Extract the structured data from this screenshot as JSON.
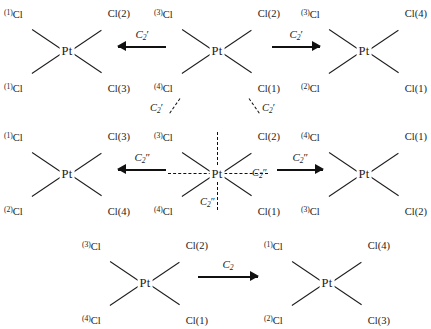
{
  "diagram": {
    "center_atom": "Pt",
    "rows": [
      {
        "row_id": "row-1",
        "structures": [
          {
            "id": "s1",
            "labels": {
              "top_left": "Cl",
              "top_left_num": "(1)",
              "top_right": "Cl",
              "top_right_num": "(2)",
              "bottom_left": "Cl",
              "bottom_left_num": "(1)",
              "bottom_right": "Cl",
              "bottom_right_num": "(3)"
            }
          },
          {
            "id": "s2",
            "labels": {
              "top_left": "Cl",
              "top_left_num": "(3)",
              "top_right": "Cl",
              "top_right_num": "(2)",
              "bottom_left": "Cl",
              "bottom_left_num": "(4)",
              "bottom_right": "Cl",
              "bottom_right_num": "(1)"
            }
          },
          {
            "id": "s3",
            "labels": {
              "top_left": "Cl",
              "top_left_num": "(3)",
              "top_right": "Cl",
              "top_right_num": "(4)",
              "bottom_left": "Cl",
              "bottom_left_num": "(2)",
              "bottom_right": "Cl",
              "bottom_right_num": "(1)"
            }
          }
        ],
        "arrows": [
          {
            "id": "a1",
            "direction": "left",
            "operator": "C",
            "subscript": "2",
            "prime": "′"
          },
          {
            "id": "a2",
            "direction": "right",
            "operator": "C",
            "subscript": "2",
            "prime": "′"
          }
        ],
        "axes": [
          {
            "id": "ax1",
            "operator": "C",
            "subscript": "2",
            "prime": "′",
            "orientation": "diagonal-down-left"
          },
          {
            "id": "ax2",
            "operator": "C",
            "subscript": "2",
            "prime": "′",
            "orientation": "diagonal-down-right"
          }
        ]
      },
      {
        "row_id": "row-2",
        "structures": [
          {
            "id": "s4",
            "labels": {
              "top_left": "Cl",
              "top_left_num": "(1)",
              "top_right": "Cl",
              "top_right_num": "(3)",
              "bottom_left": "Cl",
              "bottom_left_num": "(2)",
              "bottom_right": "Cl",
              "bottom_right_num": "(4)"
            }
          },
          {
            "id": "s5",
            "labels": {
              "top_left": "Cl",
              "top_left_num": "(3)",
              "top_right": "Cl",
              "top_right_num": "(2)",
              "bottom_left": "Cl",
              "bottom_left_num": "(4)",
              "bottom_right": "Cl",
              "bottom_right_num": "(1)"
            }
          },
          {
            "id": "s6",
            "labels": {
              "top_left": "Cl",
              "top_left_num": "(4)",
              "top_right": "Cl",
              "top_right_num": "(1)",
              "bottom_left": "Cl",
              "bottom_left_num": "(3)",
              "bottom_right": "Cl",
              "bottom_right_num": "(2)"
            }
          }
        ],
        "arrows": [
          {
            "id": "a3",
            "direction": "left",
            "operator": "C",
            "subscript": "2",
            "prime": "″"
          },
          {
            "id": "a4",
            "direction": "right",
            "operator": "C",
            "subscript": "2",
            "prime": "″"
          }
        ],
        "axes": [
          {
            "id": "ax3",
            "operator": "C",
            "subscript": "2",
            "prime": "″",
            "orientation": "horizontal"
          },
          {
            "id": "ax4",
            "operator": "C",
            "subscript": "2",
            "prime": "″",
            "orientation": "vertical"
          }
        ]
      },
      {
        "row_id": "row-3",
        "structures": [
          {
            "id": "s7",
            "labels": {
              "top_left": "Cl",
              "top_left_num": "(3)",
              "top_right": "Cl",
              "top_right_num": "(2)",
              "bottom_left": "Cl",
              "bottom_left_num": "(4)",
              "bottom_right": "Cl",
              "bottom_right_num": "(1)"
            }
          },
          {
            "id": "s8",
            "labels": {
              "top_left": "Cl",
              "top_left_num": "(1)",
              "top_right": "Cl",
              "top_right_num": "(4)",
              "bottom_left": "Cl",
              "bottom_left_num": "(2)",
              "bottom_right": "Cl",
              "bottom_right_num": "(3)"
            }
          }
        ],
        "arrows": [
          {
            "id": "a5",
            "direction": "right",
            "operator": "C",
            "subscript": "2",
            "prime": ""
          }
        ]
      }
    ],
    "colors": {
      "ink": "#1a1a1a",
      "bond": "#1d1d1d",
      "background": "#ffffff"
    }
  }
}
